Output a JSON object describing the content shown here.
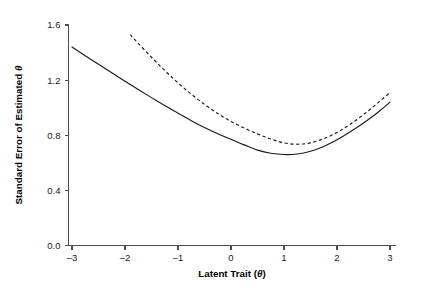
{
  "chart_data": {
    "type": "line",
    "title": "",
    "xlabel": "Latent Trait (θ)",
    "xlabel_main": "Latent Trait",
    "xlabel_paren_open": " (",
    "xlabel_symbol": "θ",
    "xlabel_paren_close": ")",
    "ylabel": "Standard Error of Estimated θ",
    "ylabel_main": "Standard Error of Estimated ",
    "ylabel_symbol": "θ",
    "xlim": [
      -3.25,
      3.25
    ],
    "ylim": [
      0.0,
      1.6
    ],
    "xticks": [
      -3,
      -2,
      -1,
      0,
      1,
      2,
      3
    ],
    "xtick_labels": [
      "–3",
      "–2",
      "–1",
      "0",
      "1",
      "2",
      "3"
    ],
    "yticks": [
      0.0,
      0.4,
      0.8,
      1.2,
      1.6
    ],
    "ytick_labels": [
      "0.0",
      "0.4",
      "0.8",
      "1.2",
      "1.6"
    ],
    "grid": false,
    "legend": "none",
    "line_color": "#1a1a1a",
    "axis_color": "#4d4d4d",
    "background": "#ffffff",
    "series": [
      {
        "name": "solid-curve",
        "style": "solid",
        "x": [
          -3.0,
          -2.75,
          -2.5,
          -2.25,
          -2.0,
          -1.75,
          -1.5,
          -1.25,
          -1.0,
          -0.75,
          -0.5,
          -0.25,
          0.0,
          0.25,
          0.5,
          0.75,
          1.0,
          1.25,
          1.5,
          1.75,
          2.0,
          2.25,
          2.5,
          2.75,
          3.0
        ],
        "y": [
          1.44,
          1.377,
          1.315,
          1.253,
          1.192,
          1.132,
          1.073,
          1.015,
          0.96,
          0.906,
          0.856,
          0.811,
          0.771,
          0.73,
          0.692,
          0.669,
          0.66,
          0.664,
          0.684,
          0.719,
          0.767,
          0.825,
          0.889,
          0.96,
          1.04
        ]
      },
      {
        "name": "dashed-curve",
        "style": "dashed",
        "x": [
          -1.9,
          -1.75,
          -1.5,
          -1.25,
          -1.0,
          -0.75,
          -0.5,
          -0.25,
          0.0,
          0.25,
          0.5,
          0.75,
          1.0,
          1.25,
          1.5,
          1.75,
          2.0,
          2.25,
          2.5,
          2.75,
          3.0
        ],
        "y": [
          1.53,
          1.467,
          1.366,
          1.27,
          1.18,
          1.098,
          1.024,
          0.958,
          0.9,
          0.852,
          0.81,
          0.773,
          0.745,
          0.735,
          0.745,
          0.775,
          0.82,
          0.88,
          0.95,
          1.028,
          1.11
        ]
      }
    ]
  }
}
